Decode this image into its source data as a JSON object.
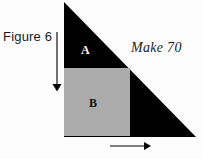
{
  "figure": {
    "caption": "Figure 6",
    "annotation": "Make 70",
    "regions": [
      {
        "id": "A",
        "label": "A",
        "fill": "#000000",
        "text_color": "#ffffff"
      },
      {
        "id": "B",
        "label": "B",
        "fill": "#ababab",
        "text_color": "#111111"
      }
    ],
    "colors": {
      "background": "#fdfdfd",
      "triangle": "#000000",
      "square": "#ababab",
      "arrow": "#000000",
      "text": "#1a1a1a"
    },
    "geometry": {
      "triangle": {
        "apex": [
          64,
          2
        ],
        "bottom_left": [
          64,
          137
        ],
        "bottom_right": [
          196,
          137
        ]
      },
      "square": {
        "left": 64,
        "top": 68,
        "right": 130,
        "bottom": 136
      }
    },
    "arrows": [
      {
        "name": "vertical-height-arrow",
        "direction": "down",
        "from": [
          57,
          32
        ],
        "to": [
          57,
          90
        ]
      },
      {
        "name": "horizontal-width-arrow",
        "direction": "right",
        "from": [
          110,
          146
        ],
        "to": [
          150,
          146
        ]
      }
    ]
  }
}
